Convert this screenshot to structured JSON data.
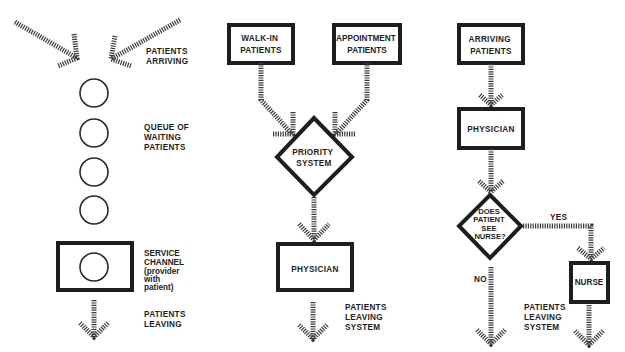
{
  "diagram": {
    "panels": [
      {
        "id": "single-channel-queue",
        "labels": {
          "arriving": [
            "PATIENTS",
            "ARRIVING"
          ],
          "queue": [
            "QUEUE OF",
            "WAITING",
            "PATIENTS"
          ],
          "service": [
            "SERVICE",
            "CHANNEL",
            "(provider",
            " with",
            " patient)"
          ],
          "leaving": [
            "PATIENTS",
            "LEAVING"
          ]
        },
        "queue_count": 4
      },
      {
        "id": "priority-system",
        "nodes": {
          "walk_in": [
            "WALK-IN",
            "PATIENTS"
          ],
          "appointment": [
            "APPOINTMENT",
            "PATIENTS"
          ],
          "priority": [
            "PRIORITY",
            "SYSTEM"
          ],
          "physician": "PHYSICIAN"
        },
        "labels": {
          "leaving": [
            "PATIENTS",
            "LEAVING",
            "SYSTEM"
          ]
        }
      },
      {
        "id": "nurse-decision",
        "nodes": {
          "arriving": [
            "ARRIVING",
            "PATIENTS"
          ],
          "physician": "PHYSICIAN",
          "decision": [
            "DOES",
            "PATIENT",
            "SEE",
            "NURSE?"
          ],
          "nurse": "NURSE"
        },
        "edge_labels": {
          "yes": "YES",
          "no": "NO"
        },
        "labels": {
          "leaving": [
            "PATIENTS",
            "LEAVING",
            "SYSTEM"
          ]
        }
      }
    ],
    "colors": {
      "ink": "#1e1e1e",
      "hatch": "#3a3a3a",
      "background": "#ffffff"
    }
  }
}
